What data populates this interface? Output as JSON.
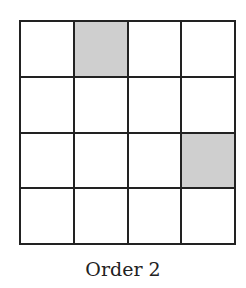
{
  "diagram": {
    "rows": 4,
    "cols": 4,
    "shaded_cells": [
      [
        0,
        1
      ],
      [
        2,
        3
      ]
    ],
    "shade_color": "#cfcfcf",
    "caption": "Order 2"
  }
}
